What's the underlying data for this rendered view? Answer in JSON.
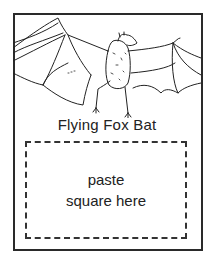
{
  "card": {
    "caption": "Flying Fox Bat",
    "paste_area": {
      "line1": "paste",
      "line2": "square here"
    },
    "illustration": "flying-fox-bat-line-drawing"
  }
}
